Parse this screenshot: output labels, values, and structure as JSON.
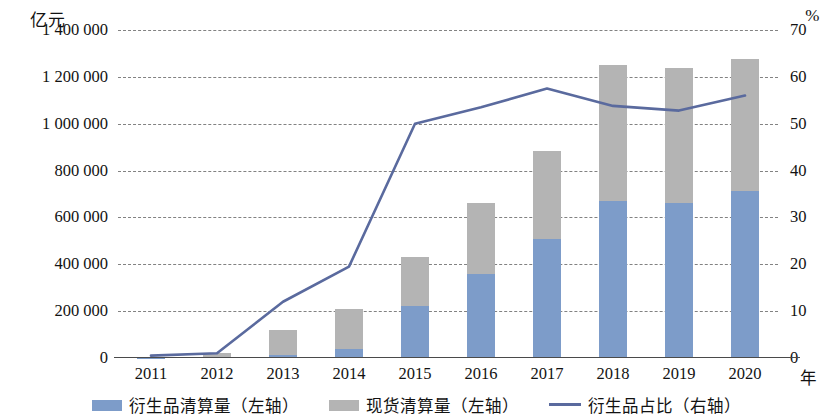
{
  "axes": {
    "left_unit": "亿元",
    "right_unit": "%",
    "x_unit": "年"
  },
  "legend": {
    "items": [
      {
        "label": "衍生品清算量（左轴）",
        "marker": "square-swatch-blue",
        "color": "#7d9cc9"
      },
      {
        "label": "现货清算量（左轴）",
        "marker": "square-swatch-gray",
        "color": "#b4b4b4"
      },
      {
        "label": "衍生品占比（右轴）",
        "marker": "line-swatch",
        "color": "#5a6a9e"
      }
    ]
  },
  "chart_data": {
    "type": "bar",
    "title": "",
    "subtitle": "",
    "xlabel": "年",
    "ylabel": "亿元",
    "y2label": "%",
    "categories": [
      "2011",
      "2012",
      "2013",
      "2014",
      "2015",
      "2016",
      "2017",
      "2018",
      "2019",
      "2020"
    ],
    "ylim": [
      0,
      1400000
    ],
    "y2lim": [
      0,
      70
    ],
    "yticks": [
      "0",
      "200 000",
      "400 000",
      "600 000",
      "800 000",
      "1 000 000",
      "1 200 000",
      "1 400 000"
    ],
    "ytick_values": [
      0,
      200000,
      400000,
      600000,
      800000,
      1000000,
      1200000,
      1400000
    ],
    "y2ticks": [
      "0",
      "10",
      "20",
      "30",
      "40",
      "50",
      "60",
      "70"
    ],
    "y2tick_values": [
      0,
      10,
      20,
      30,
      40,
      50,
      60,
      70
    ],
    "grid": true,
    "stacked": true,
    "legend_position": "bottom",
    "series": [
      {
        "name": "衍生品清算量（左轴）",
        "type": "bar",
        "axis": "left",
        "color": "#7d9cc9",
        "values": [
          2000,
          4000,
          12000,
          40000,
          220000,
          360000,
          510000,
          670000,
          660000,
          715000
        ]
      },
      {
        "name": "现货清算量（左轴）",
        "type": "bar",
        "axis": "left",
        "color": "#b4b4b4",
        "values": [
          4000,
          16000,
          108000,
          170000,
          210000,
          300000,
          375000,
          580000,
          580000,
          560000
        ]
      },
      {
        "name": "衍生品占比（右轴）",
        "type": "line",
        "axis": "right",
        "color": "#5a6a9e",
        "values": [
          0.5,
          1.0,
          12.0,
          19.5,
          50.0,
          53.5,
          57.5,
          53.8,
          52.8,
          56.0
        ]
      }
    ],
    "totals": [
      6000,
      20000,
      120000,
      210000,
      430000,
      660000,
      885000,
      1250000,
      1240000,
      1275000
    ]
  }
}
